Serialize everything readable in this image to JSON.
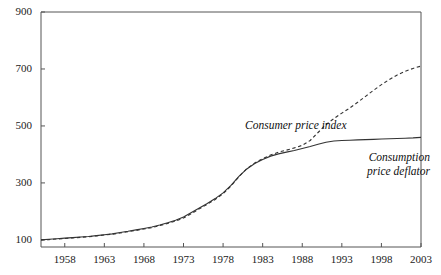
{
  "chart_data": {
    "type": "line",
    "title": "",
    "subtitle": "",
    "xlabel": "",
    "ylabel": "",
    "xlim": [
      1955,
      2003
    ],
    "ylim": [
      75,
      900
    ],
    "grid": false,
    "legend_position": "inline-annotations",
    "xticks": [
      1958,
      1963,
      1968,
      1973,
      1978,
      1983,
      1988,
      1993,
      1998,
      2003
    ],
    "yticks": [
      100,
      300,
      500,
      700,
      900
    ],
    "xtick_labels": [
      "1958",
      "1963",
      "1968",
      "1973",
      "1978",
      "1983",
      "1988",
      "1993",
      "1998",
      "2003"
    ],
    "ytick_labels": [
      "100",
      "300",
      "500",
      "700",
      "900"
    ],
    "x": [
      1955,
      1956,
      1957,
      1958,
      1959,
      1960,
      1961,
      1962,
      1963,
      1964,
      1965,
      1966,
      1967,
      1968,
      1969,
      1970,
      1971,
      1972,
      1973,
      1974,
      1975,
      1976,
      1977,
      1978,
      1979,
      1980,
      1981,
      1982,
      1983,
      1984,
      1985,
      1986,
      1987,
      1988,
      1989,
      1990,
      1991,
      1992,
      1993,
      1994,
      1995,
      1996,
      1997,
      1998,
      1999,
      2000,
      2001,
      2002,
      2003
    ],
    "series": [
      {
        "name": "Consumer price index",
        "style": "dashed",
        "color": "#333333",
        "annotation": "Consumer price index",
        "values": [
          100,
          101,
          103,
          105,
          107,
          109,
          111,
          113,
          116,
          119,
          123,
          127,
          131,
          135,
          140,
          147,
          154,
          161,
          171,
          186,
          203,
          219,
          236,
          255,
          282,
          317,
          352,
          383,
          404,
          421,
          436,
          449,
          464,
          483,
          508,
          541,
          572,
          597,
          620,
          642,
          668,
          698,
          730,
          763,
          797,
          834,
          872,
          908,
          940
        ],
        "values_plot": [
          100,
          101,
          103,
          105,
          107,
          109,
          111,
          114,
          117,
          120,
          124,
          129,
          133,
          138,
          143,
          150,
          158,
          166,
          177,
          192,
          209,
          225,
          242,
          262,
          289,
          322,
          350,
          370,
          385,
          398,
          408,
          415,
          423,
          432,
          449,
          477,
          505,
          526,
          545,
          563,
          583,
          604,
          625,
          645,
          663,
          679,
          692,
          702,
          710
        ]
      },
      {
        "name": "Consumption price deflator",
        "style": "solid",
        "color": "#333333",
        "annotation_line1": "Consumption",
        "annotation_line2": "price deflator",
        "values_plot": [
          100,
          102,
          104,
          106,
          108,
          110,
          112,
          115,
          118,
          121,
          126,
          130,
          135,
          140,
          145,
          152,
          160,
          169,
          180,
          196,
          212,
          228,
          245,
          265,
          291,
          323,
          349,
          368,
          382,
          394,
          402,
          408,
          414,
          421,
          428,
          436,
          443,
          447,
          449,
          450,
          451,
          452,
          453,
          454,
          455,
          456,
          457,
          458,
          460
        ]
      }
    ],
    "annotations": [
      {
        "text": "Consumer price index",
        "x": 1985,
        "y": 470,
        "style": "italic"
      },
      {
        "text": "Consumption price deflator",
        "x": 1994,
        "y": 350,
        "style": "italic"
      }
    ]
  },
  "axes": {
    "frame_color": "#555555",
    "tick_color": "#555555"
  }
}
